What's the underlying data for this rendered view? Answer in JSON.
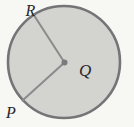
{
  "figure": {
    "type": "circle-with-center-and-two-radii",
    "labels": {
      "center": "Q",
      "upper_left_point": "R",
      "lower_left_point": "P"
    },
    "colors": {
      "background": "#f7f7f4",
      "circle_fill": "#d3d3cf",
      "circle_stroke": "#757578",
      "radius_stroke": "#8b8b8d",
      "center_dot": "#7b7b7e",
      "label_text": "#26262a"
    }
  }
}
